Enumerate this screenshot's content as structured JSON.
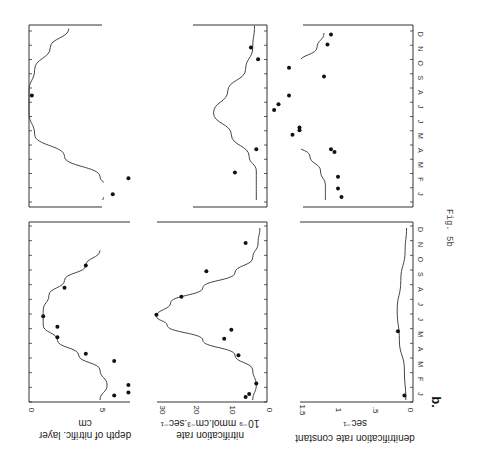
{
  "figure": {
    "caption": "Fig. 5b",
    "panel_letter": "b.",
    "months": [
      "J",
      "F",
      "M",
      "A",
      "M",
      "J",
      "J",
      "A",
      "S",
      "O",
      "N",
      "D"
    ]
  },
  "chart_data": [
    {
      "type": "scatter",
      "id": "depth_year1",
      "title": "",
      "ylabel": "depth of nitrific. layer",
      "yunit": "cm",
      "xlabel": "month",
      "ylim": [
        0,
        7
      ],
      "yticks": [
        0,
        5
      ],
      "categories": [
        "J",
        "F",
        "M",
        "A",
        "M",
        "J",
        "J",
        "A",
        "S",
        "O",
        "N",
        "D"
      ],
      "points": [
        [
          0.3,
          6
        ],
        [
          0.5,
          7
        ],
        [
          1.0,
          7
        ],
        [
          2.6,
          6
        ],
        [
          3.1,
          4
        ],
        [
          4.2,
          2
        ],
        [
          4.9,
          2
        ],
        [
          5.6,
          1
        ],
        [
          7.5,
          2.5
        ],
        [
          9.0,
          4
        ]
      ],
      "curve": [
        [
          0,
          5
        ],
        [
          1,
          5.5
        ],
        [
          2,
          5
        ],
        [
          3,
          3.5
        ],
        [
          4,
          2
        ],
        [
          5,
          1
        ],
        [
          6,
          1
        ],
        [
          7,
          1.4
        ],
        [
          8,
          2.5
        ],
        [
          9,
          4
        ],
        [
          10,
          5
        ]
      ]
    },
    {
      "type": "scatter",
      "id": "nitrification_year1",
      "ylabel": "nitrification rate",
      "yunit": "10⁻⁹ mmol.cm⁻³.sec⁻¹",
      "xlabel": "month",
      "ylim": [
        0,
        30
      ],
      "yticks": [
        0,
        10,
        20,
        30
      ],
      "categories": [
        "J",
        "F",
        "M",
        "A",
        "M",
        "J",
        "J",
        "A",
        "S",
        "O",
        "N",
        "D"
      ],
      "points": [
        [
          0.2,
          6
        ],
        [
          0.4,
          5
        ],
        [
          1.1,
          3
        ],
        [
          3.0,
          8
        ],
        [
          4.1,
          12
        ],
        [
          4.7,
          10
        ],
        [
          5.7,
          31
        ],
        [
          6.9,
          24
        ],
        [
          8.6,
          17
        ],
        [
          10.5,
          6
        ]
      ],
      "curve": [
        [
          0,
          4
        ],
        [
          1,
          3
        ],
        [
          2,
          4
        ],
        [
          3,
          9
        ],
        [
          4,
          18
        ],
        [
          5,
          28
        ],
        [
          5.6,
          31
        ],
        [
          6.5,
          27
        ],
        [
          7.5,
          18
        ],
        [
          8.5,
          9
        ],
        [
          9.5,
          4
        ],
        [
          10.5,
          2.5
        ],
        [
          11.5,
          2
        ]
      ]
    },
    {
      "type": "scatter",
      "id": "denitrification_year1",
      "ylabel": "denitrification rate constant",
      "yunit": "sec⁻¹",
      "xlabel": "month",
      "ylim": [
        0,
        1.5
      ],
      "yticks": [
        "0",
        ".5",
        "1",
        "1.5"
      ],
      "categories": [
        "J",
        "F",
        "M",
        "A",
        "M",
        "J",
        "J",
        "A",
        "S",
        "O",
        "N",
        "D"
      ],
      "points": [
        [
          0.3,
          0.05
        ],
        [
          4.6,
          0.14
        ]
      ],
      "curve": [
        [
          0,
          0.03
        ],
        [
          2,
          0.05
        ],
        [
          4,
          0.12
        ],
        [
          6,
          0.15
        ],
        [
          8,
          0.1
        ],
        [
          10,
          0.04
        ],
        [
          11.5,
          0.02
        ]
      ]
    },
    {
      "type": "scatter",
      "id": "depth_year2",
      "ylabel": "depth of nitrific. layer",
      "yunit": "cm",
      "ylim": [
        0,
        7
      ],
      "points": [
        [
          0.4,
          5.9
        ],
        [
          1.5,
          7.0
        ],
        [
          7.2,
          0.2
        ]
      ],
      "curve": [
        [
          0,
          5.2
        ],
        [
          0.7,
          5.8
        ],
        [
          1.6,
          5
        ],
        [
          3,
          2.5
        ],
        [
          4.5,
          0.4
        ],
        [
          6,
          0
        ],
        [
          7.5,
          0
        ],
        [
          9,
          0.4
        ],
        [
          10.5,
          1.5
        ],
        [
          11.8,
          2.8
        ]
      ]
    },
    {
      "type": "scatter",
      "id": "nitrification_year2",
      "ylabel": "nitrification rate",
      "yunit": "10⁻⁹ mmol.cm⁻³.sec⁻¹",
      "ylim": [
        0,
        30
      ],
      "points": [
        [
          1.9,
          9
        ],
        [
          3.5,
          3
        ],
        [
          6.2,
          -2
        ],
        [
          9.7,
          2.5
        ],
        [
          10.5,
          4.5
        ]
      ],
      "curve": [
        [
          0,
          3
        ],
        [
          2,
          3
        ],
        [
          3,
          5
        ],
        [
          4.5,
          10
        ],
        [
          6,
          15
        ],
        [
          7.5,
          11
        ],
        [
          9,
          6
        ],
        [
          10.5,
          4
        ],
        [
          12,
          3.5
        ]
      ]
    },
    {
      "type": "scatter",
      "id": "denitrification_year2",
      "ylabel": "denitrification rate constant",
      "yunit": "sec⁻¹",
      "ylim": [
        0,
        1.5
      ],
      "points": [
        [
          0.2,
          0.45
        ],
        [
          0.8,
          0.5
        ],
        [
          1.6,
          0.5
        ],
        [
          3.3,
          0.55
        ],
        [
          3.5,
          0.6
        ],
        [
          4.5,
          1.15
        ],
        [
          4.8,
          1.05
        ],
        [
          5.0,
          1.05
        ],
        [
          6.6,
          1.35
        ],
        [
          7.2,
          1.2
        ],
        [
          8.5,
          0.7
        ],
        [
          9.1,
          1.2
        ],
        [
          10.7,
          0.65
        ],
        [
          11.4,
          0.6
        ]
      ],
      "curve": [
        [
          0,
          0.68
        ],
        [
          1,
          0.68
        ],
        [
          2,
          0.75
        ],
        [
          3,
          0.9
        ],
        [
          4,
          1.15
        ],
        [
          5,
          1.4
        ],
        [
          6,
          1.65
        ],
        [
          6.6,
          1.72
        ],
        [
          7.5,
          1.6
        ],
        [
          8.5,
          1.35
        ],
        [
          9.5,
          1.05
        ],
        [
          10.5,
          0.8
        ],
        [
          11.5,
          0.7
        ]
      ]
    }
  ]
}
